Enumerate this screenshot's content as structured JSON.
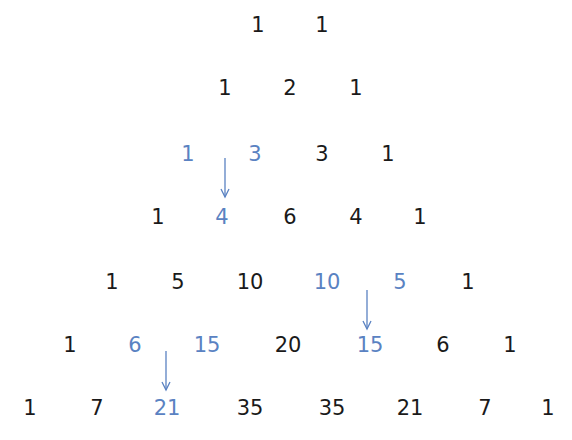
{
  "colors": {
    "text": "#1a1a1a",
    "highlight": "#5a82c2",
    "background": "#ffffff"
  },
  "rows": [
    {
      "y": 25,
      "cells": [
        {
          "v": "1",
          "x": 258
        },
        {
          "v": "1",
          "x": 322
        }
      ]
    },
    {
      "y": 88,
      "cells": [
        {
          "v": "1",
          "x": 225
        },
        {
          "v": "2",
          "x": 290
        },
        {
          "v": "1",
          "x": 356
        }
      ]
    },
    {
      "y": 154,
      "cells": [
        {
          "v": "1",
          "x": 188,
          "hl": true
        },
        {
          "v": "3",
          "x": 255,
          "hl": true
        },
        {
          "v": "3",
          "x": 322
        },
        {
          "v": "1",
          "x": 388
        }
      ]
    },
    {
      "y": 217,
      "cells": [
        {
          "v": "1",
          "x": 158
        },
        {
          "v": "4",
          "x": 222,
          "hl": true
        },
        {
          "v": "6",
          "x": 290
        },
        {
          "v": "4",
          "x": 356
        },
        {
          "v": "1",
          "x": 420
        }
      ]
    },
    {
      "y": 282,
      "cells": [
        {
          "v": "1",
          "x": 112
        },
        {
          "v": "5",
          "x": 178
        },
        {
          "v": "10",
          "x": 250
        },
        {
          "v": "10",
          "x": 327,
          "hl": true
        },
        {
          "v": "5",
          "x": 400,
          "hl": true
        },
        {
          "v": "1",
          "x": 468
        }
      ]
    },
    {
      "y": 345,
      "cells": [
        {
          "v": "1",
          "x": 70
        },
        {
          "v": "6",
          "x": 135,
          "hl": true
        },
        {
          "v": "15",
          "x": 207,
          "hl": true
        },
        {
          "v": "20",
          "x": 288
        },
        {
          "v": "15",
          "x": 370,
          "hl": true
        },
        {
          "v": "6",
          "x": 443
        },
        {
          "v": "1",
          "x": 510
        }
      ]
    },
    {
      "y": 408,
      "cells": [
        {
          "v": "1",
          "x": 30
        },
        {
          "v": "7",
          "x": 97
        },
        {
          "v": "21",
          "x": 167,
          "hl": true
        },
        {
          "v": "35",
          "x": 250
        },
        {
          "v": "35",
          "x": 332
        },
        {
          "v": "21",
          "x": 410
        },
        {
          "v": "7",
          "x": 485
        },
        {
          "v": "1",
          "x": 548
        }
      ]
    }
  ],
  "arrows": [
    {
      "x": 225,
      "y1": 158,
      "y2": 197,
      "label": "1 + 3 = 4"
    },
    {
      "x": 367,
      "y1": 290,
      "y2": 329,
      "label": "10 + 5 = 15"
    },
    {
      "x": 166,
      "y1": 351,
      "y2": 390,
      "label": "6 + 15 = 21"
    }
  ]
}
